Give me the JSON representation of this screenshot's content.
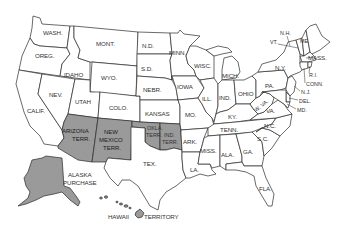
{
  "map": {
    "title": "United States map with territories",
    "colors": {
      "state_fill": "#ffffff",
      "territory_fill": "#9a9a9a",
      "border": "#2a2a2a",
      "label": "#333333"
    },
    "states": [
      {
        "id": "wash",
        "label": "WASH."
      },
      {
        "id": "oreg",
        "label": "OREG."
      },
      {
        "id": "calif",
        "label": "CALIF."
      },
      {
        "id": "idaho",
        "label": "IDAHO"
      },
      {
        "id": "nev",
        "label": "NEV."
      },
      {
        "id": "mont",
        "label": "MONT."
      },
      {
        "id": "wyo",
        "label": "WYO."
      },
      {
        "id": "utah",
        "label": "UTAH"
      },
      {
        "id": "colo",
        "label": "COLO."
      },
      {
        "id": "nd",
        "label": "N.D."
      },
      {
        "id": "sd",
        "label": "S.D."
      },
      {
        "id": "nebr",
        "label": "NEBR."
      },
      {
        "id": "kansas",
        "label": "KANSAS"
      },
      {
        "id": "tex",
        "label": "TEX."
      },
      {
        "id": "minn",
        "label": "MINN."
      },
      {
        "id": "iowa",
        "label": "IOWA"
      },
      {
        "id": "mo",
        "label": "MO."
      },
      {
        "id": "ark",
        "label": "ARK."
      },
      {
        "id": "la",
        "label": "LA."
      },
      {
        "id": "wisc",
        "label": "WISC."
      },
      {
        "id": "ill",
        "label": "ILL."
      },
      {
        "id": "mich",
        "label": "MICH."
      },
      {
        "id": "ind",
        "label": "IND."
      },
      {
        "id": "ohio",
        "label": "OHIO"
      },
      {
        "id": "ky",
        "label": "KY."
      },
      {
        "id": "tenn",
        "label": "TENN."
      },
      {
        "id": "miss",
        "label": "MISS."
      },
      {
        "id": "ala",
        "label": "ALA."
      },
      {
        "id": "ga",
        "label": "GA."
      },
      {
        "id": "fla",
        "label": "FLA."
      },
      {
        "id": "sc",
        "label": "S.C."
      },
      {
        "id": "nc",
        "label": "N.C."
      },
      {
        "id": "va",
        "label": "VA."
      },
      {
        "id": "wva",
        "label": "W. VA."
      },
      {
        "id": "pa",
        "label": "PA."
      },
      {
        "id": "ny",
        "label": "N.Y."
      },
      {
        "id": "vt",
        "label": "VT."
      },
      {
        "id": "nh",
        "label": "N.H."
      },
      {
        "id": "me",
        "label": "ME."
      },
      {
        "id": "mass",
        "label": "MASS."
      },
      {
        "id": "ri",
        "label": "R.I."
      },
      {
        "id": "conn",
        "label": "CONN."
      },
      {
        "id": "nj",
        "label": "N.J."
      },
      {
        "id": "del",
        "label": "DEL."
      },
      {
        "id": "md",
        "label": "MD."
      }
    ],
    "territories": [
      {
        "id": "arizona",
        "label_line1": "ARIZONA",
        "label_line2": "TERR."
      },
      {
        "id": "new_mexico",
        "label_line1": "NEW",
        "label_line2": "MEXICO",
        "label_line3": "TERR."
      },
      {
        "id": "okla",
        "label_line1": "OKLA.",
        "label_line2": "TERR."
      },
      {
        "id": "ind_terr",
        "label_line1": "IND.",
        "label_line2": "TERR."
      },
      {
        "id": "alaska",
        "label_line1": "ALASKA",
        "label_line2": "PURCHASE"
      },
      {
        "id": "hawaii",
        "label_left": "HAWAII",
        "label_right": "TERRITORY"
      }
    ]
  }
}
